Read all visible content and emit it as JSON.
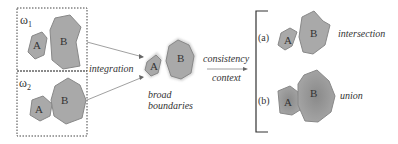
{
  "diagram": {
    "panel1": {
      "label": "ω",
      "subscript": "1",
      "shapes": [
        "A",
        "B"
      ]
    },
    "panel2": {
      "label": "ω",
      "subscript": "2",
      "shapes": [
        "A",
        "B"
      ]
    },
    "integration_label": "integration",
    "merged": {
      "shapes": [
        "A",
        "B"
      ],
      "caption_line1": "broad",
      "caption_line2": "boundaries"
    },
    "consistency_label": "consistency",
    "context_label": "context",
    "result_a": {
      "marker": "(a)",
      "label": "intersection",
      "shapes": [
        "A",
        "B"
      ]
    },
    "result_b": {
      "marker": "(b)",
      "label": "union",
      "shapes": [
        "A",
        "B"
      ]
    }
  },
  "colors": {
    "shape_fill": "#a9a9a9",
    "shape_fill_dark": "#8f8f8f",
    "shape_stroke": "#777777",
    "text": "#333333"
  }
}
